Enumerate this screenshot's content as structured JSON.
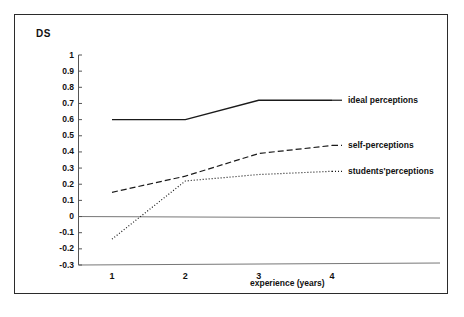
{
  "figure": {
    "y_axis_title": "DS",
    "x_axis_label": "experience (years)"
  },
  "chart_data": {
    "type": "line",
    "title": "",
    "xlabel": "experience (years)",
    "ylabel": "DS",
    "x": [
      1,
      2,
      3,
      4
    ],
    "xticklabels": [
      "1",
      "2",
      "3",
      "4"
    ],
    "xlim": [
      0.55,
      4.45
    ],
    "ylim": [
      -0.3,
      1
    ],
    "yticks": [
      1,
      0.9,
      0.8,
      0.7,
      0.6,
      0.5,
      0.4,
      0.3,
      0.2,
      0.1,
      0,
      -0.1,
      -0.2,
      -0.3
    ],
    "yticklabels": [
      "1",
      "0.9",
      "0.8",
      "0.7",
      "0.6",
      "0.5",
      "0.4",
      "0.3",
      "0.2",
      "0.1",
      "0",
      "-0.1",
      "-0.2",
      "-0.3"
    ],
    "grid": false,
    "legend_position": "right-inline",
    "zero_reference_line": true,
    "series": [
      {
        "name": "ideal perceptions",
        "style": "solid",
        "color": "#1a1a1a",
        "values": [
          0.6,
          0.6,
          0.72,
          0.72
        ]
      },
      {
        "name": "self-perceptions",
        "style": "dashed",
        "color": "#1a1a1a",
        "values": [
          0.15,
          0.25,
          0.39,
          0.44
        ]
      },
      {
        "name": "students'perceptions",
        "style": "dotted",
        "color": "#1a1a1a",
        "values": [
          -0.14,
          0.22,
          0.26,
          0.28
        ]
      }
    ]
  },
  "legend": {
    "items": [
      {
        "label": "ideal perceptions"
      },
      {
        "label": "self-perceptions"
      },
      {
        "label": "students'perceptions"
      }
    ]
  }
}
